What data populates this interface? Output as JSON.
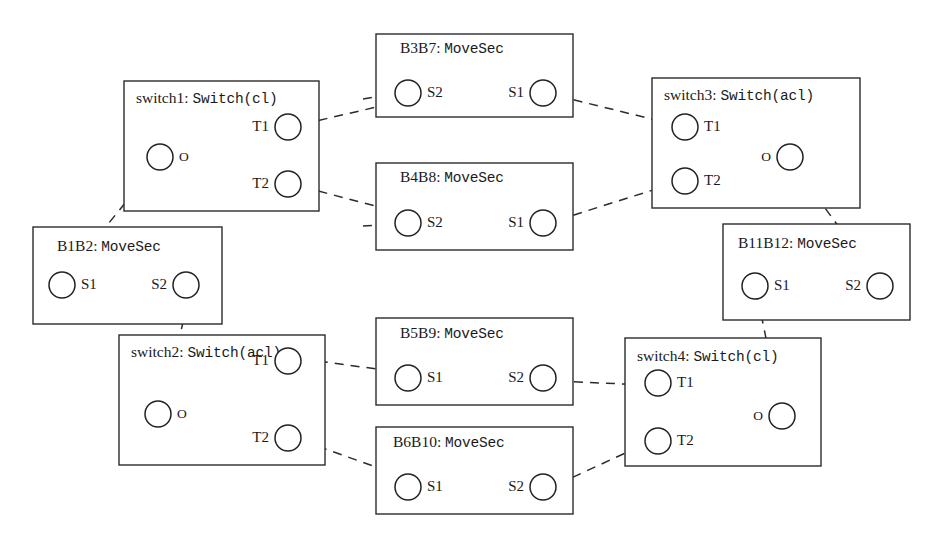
{
  "diagram": {
    "kind": "uml-composite-structure",
    "title_visible": false,
    "canvas": {
      "width": 942,
      "height": 539
    },
    "colors": {
      "background": "#ffffff",
      "stroke": "#2b2b2b",
      "port_stroke": "#222222",
      "text": "#1a1a1a"
    }
  },
  "components": [
    {
      "id": "switch1",
      "name_part": "switch1: ",
      "type_part": "Switch(cl)",
      "full_label": "switch1: Switch(cl)",
      "stereotype": "Switch",
      "config": "cl",
      "box": {
        "x": 124,
        "y": 81,
        "w": 195,
        "h": 130
      },
      "title": {
        "x": 136,
        "y": 99
      },
      "ports": [
        {
          "name": "O",
          "cx": 160,
          "cy": 157,
          "r": 13,
          "label_side": "right"
        },
        {
          "name": "T1",
          "cx": 288,
          "cy": 127,
          "r": 13,
          "label_side": "left"
        },
        {
          "name": "T2",
          "cx": 288,
          "cy": 184,
          "r": 13,
          "label_side": "left"
        }
      ]
    },
    {
      "id": "switch2",
      "name_part": "switch2: ",
      "type_part": "Switch(acl)",
      "full_label": "switch2: Switch(acl)",
      "stereotype": "Switch",
      "config": "acl",
      "box": {
        "x": 119,
        "y": 335,
        "w": 206,
        "h": 130
      },
      "title": {
        "x": 131,
        "y": 353
      },
      "ports": [
        {
          "name": "O",
          "cx": 158,
          "cy": 414,
          "r": 13,
          "label_side": "right"
        },
        {
          "name": "T1",
          "cx": 288,
          "cy": 361,
          "r": 13,
          "label_side": "left"
        },
        {
          "name": "T2",
          "cx": 288,
          "cy": 438,
          "r": 13,
          "label_side": "left"
        }
      ]
    },
    {
      "id": "switch3",
      "name_part": "switch3: ",
      "type_part": "Switch(acl)",
      "full_label": "switch3: Switch(acl)",
      "stereotype": "Switch",
      "config": "acl",
      "box": {
        "x": 652,
        "y": 78,
        "w": 208,
        "h": 130
      },
      "title": {
        "x": 664,
        "y": 96
      },
      "ports": [
        {
          "name": "T1",
          "cx": 685,
          "cy": 127,
          "r": 13,
          "label_side": "right"
        },
        {
          "name": "T2",
          "cx": 685,
          "cy": 181,
          "r": 13,
          "label_side": "right"
        },
        {
          "name": "O",
          "cx": 790,
          "cy": 157,
          "r": 13,
          "label_side": "left"
        }
      ]
    },
    {
      "id": "switch4",
      "name_part": "switch4: ",
      "type_part": "Switch(cl)",
      "full_label": "switch4: Switch(cl)",
      "stereotype": "Switch",
      "config": "cl",
      "box": {
        "x": 625,
        "y": 338,
        "w": 196,
        "h": 128
      },
      "title": {
        "x": 637,
        "y": 357
      },
      "ports": [
        {
          "name": "T1",
          "cx": 658,
          "cy": 383,
          "r": 13,
          "label_side": "right"
        },
        {
          "name": "T2",
          "cx": 658,
          "cy": 441,
          "r": 13,
          "label_side": "right"
        },
        {
          "name": "O",
          "cx": 782,
          "cy": 416,
          "r": 13,
          "label_side": "left"
        }
      ]
    },
    {
      "id": "B1B2",
      "name_part": "B1B2: ",
      "type_part": "MoveSec",
      "full_label": "B1B2: MoveSec",
      "stereotype": "MoveSec",
      "config": "",
      "box": {
        "x": 33,
        "y": 227,
        "w": 189,
        "h": 97
      },
      "title": {
        "x": 57,
        "y": 247
      },
      "ports": [
        {
          "name": "S1",
          "cx": 62,
          "cy": 285,
          "r": 13,
          "label_side": "right"
        },
        {
          "name": "S2",
          "cx": 186,
          "cy": 285,
          "r": 13,
          "label_side": "left"
        }
      ]
    },
    {
      "id": "B3B7",
      "name_part": "B3B7: ",
      "type_part": "MoveSec",
      "full_label": "B3B7: MoveSec",
      "stereotype": "MoveSec",
      "config": "",
      "box": {
        "x": 376,
        "y": 34,
        "w": 197,
        "h": 83
      },
      "title": {
        "x": 400,
        "y": 49
      },
      "ports": [
        {
          "name": "S2",
          "cx": 408,
          "cy": 93,
          "r": 13,
          "label_side": "right"
        },
        {
          "name": "S1",
          "cx": 543,
          "cy": 93,
          "r": 13,
          "label_side": "left"
        }
      ]
    },
    {
      "id": "B4B8",
      "name_part": "B4B8: ",
      "type_part": "MoveSec",
      "full_label": "B4B8: MoveSec",
      "stereotype": "MoveSec",
      "config": "",
      "box": {
        "x": 376,
        "y": 163,
        "w": 197,
        "h": 87
      },
      "title": {
        "x": 400,
        "y": 178
      },
      "ports": [
        {
          "name": "S2",
          "cx": 408,
          "cy": 223,
          "r": 13,
          "label_side": "right"
        },
        {
          "name": "S1",
          "cx": 543,
          "cy": 223,
          "r": 13,
          "label_side": "left"
        }
      ]
    },
    {
      "id": "B5B9",
      "name_part": "B5B9: ",
      "type_part": "MoveSec",
      "full_label": "B5B9: MoveSec",
      "stereotype": "MoveSec",
      "config": "",
      "box": {
        "x": 376,
        "y": 318,
        "w": 197,
        "h": 87
      },
      "title": {
        "x": 400,
        "y": 334
      },
      "ports": [
        {
          "name": "S1",
          "cx": 408,
          "cy": 378,
          "r": 13,
          "label_side": "right"
        },
        {
          "name": "S2",
          "cx": 543,
          "cy": 378,
          "r": 13,
          "label_side": "left"
        }
      ]
    },
    {
      "id": "B6B10",
      "name_part": "B6B10: ",
      "type_part": "MoveSec",
      "full_label": "B6B10: MoveSec",
      "stereotype": "MoveSec",
      "config": "",
      "box": {
        "x": 376,
        "y": 427,
        "w": 197,
        "h": 87
      },
      "title": {
        "x": 393,
        "y": 443
      },
      "ports": [
        {
          "name": "S1",
          "cx": 408,
          "cy": 487,
          "r": 13,
          "label_side": "right"
        },
        {
          "name": "S2",
          "cx": 543,
          "cy": 487,
          "r": 13,
          "label_side": "left"
        }
      ]
    },
    {
      "id": "B11B12",
      "name_part": "B11B12: ",
      "type_part": "MoveSec",
      "full_label": "B11B12: MoveSec",
      "stereotype": "MoveSec",
      "config": "",
      "box": {
        "x": 723,
        "y": 224,
        "w": 187,
        "h": 96
      },
      "title": {
        "x": 738,
        "y": 244
      },
      "ports": [
        {
          "name": "S1",
          "cx": 755,
          "cy": 286,
          "r": 13,
          "label_side": "right"
        },
        {
          "name": "S2",
          "cx": 880,
          "cy": 286,
          "r": 13,
          "label_side": "left"
        }
      ]
    }
  ],
  "connectors": [
    {
      "id": "c-switch1T1-B3B7S1",
      "from": "switch1.T1",
      "to": "B3B7.S1",
      "path": "M 303 124 L 420 97",
      "arrow_at": [
        303,
        124
      ],
      "arrow_dir": "left",
      "arrow2_at": [
        556,
        93
      ],
      "arrow2_dir": "left"
    },
    {
      "id": "c-B3B7S2-left",
      "from": "B3B7.S2",
      "to": "switch1",
      "path": "M 363 99 L 394 94",
      "arrow_at": [
        396,
        94
      ],
      "arrow_dir": "right"
    },
    {
      "id": "c-switch1T2-B4B8S1",
      "from": "switch1.T2",
      "to": "B4B8.S1",
      "path": "M 303 187 L 421 218",
      "arrow_at": [
        303,
        187
      ],
      "arrow_dir": "left",
      "arrow2_at": [
        556,
        223
      ],
      "arrow2_dir": "left"
    },
    {
      "id": "c-B4B8S2-left",
      "from": "B4B8.S2",
      "to": "switch1",
      "path": "M 363 226 L 394 224",
      "arrow_at": [
        396,
        224
      ],
      "arrow_dir": "right"
    },
    {
      "id": "c-B3B7S1-switch3T1",
      "from": "B3B7.S1",
      "to": "switch3.T1",
      "path": "M 558 96 L 672 124",
      "arrow_at": [
        672,
        124
      ],
      "arrow_dir": "right"
    },
    {
      "id": "c-B4B8S1-switch3T2",
      "from": "B4B8.S1",
      "to": "switch3.T2",
      "path": "M 558 220 L 672 184",
      "arrow_at": [
        672,
        184
      ],
      "arrow_dir": "right"
    },
    {
      "id": "c-switch1O-B1B2S1",
      "from": "B1B2.S1",
      "to": "switch1.O",
      "path": "M 69 272 L 152 170",
      "arrow_at": [
        152,
        170
      ],
      "arrow_dir": "up-right"
    },
    {
      "id": "c-B1B2S2-switch2O",
      "from": "B1B2.S2",
      "to": "switch2.O",
      "path": "M 163 407 L 189 297",
      "arrow_at": [
        189,
        297
      ],
      "arrow_dir": "up"
    },
    {
      "id": "c-switch2T1-B5B9S1",
      "from": "switch2.T1",
      "to": "B5B9.S1",
      "path": "M 303 359 L 421 375",
      "arrow_at": [
        303,
        359
      ],
      "arrow_dir": "left",
      "arrow2_at": [
        395,
        378
      ],
      "arrow2_dir": "right"
    },
    {
      "id": "c-switch2T2-B6B10S1",
      "from": "switch2.T2",
      "to": "B6B10.S1",
      "path": "M 303 441 L 421 483",
      "arrow_at": [
        303,
        441
      ],
      "arrow_dir": "left",
      "arrow2_at": [
        395,
        487
      ],
      "arrow2_dir": "right"
    },
    {
      "id": "c-B5B9S2-switch4T1",
      "from": "B5B9.S2",
      "to": "switch4.T1",
      "path": "M 558 381 L 645 385",
      "arrow_at": [
        645,
        385
      ],
      "arrow_dir": "right"
    },
    {
      "id": "c-B6B10S2-switch4T2",
      "from": "B6B10.S2",
      "to": "switch4.T2",
      "path": "M 558 484 L 645 444",
      "arrow_at": [
        645,
        444
      ],
      "arrow_dir": "right"
    },
    {
      "id": "c-switch3O-B11B12S2",
      "from": "switch3.O",
      "to": "B11B12.S2",
      "path": "M 797 170 L 872 272",
      "arrow_at": [
        872,
        272
      ],
      "arrow_dir": "down-right"
    },
    {
      "id": "c-B11B12S1-switch4O",
      "from": "B11B12.S1",
      "to": "switch4.O",
      "path": "M 758 299 L 779 402",
      "arrow_at": [
        779,
        402
      ],
      "arrow_dir": "down"
    }
  ]
}
